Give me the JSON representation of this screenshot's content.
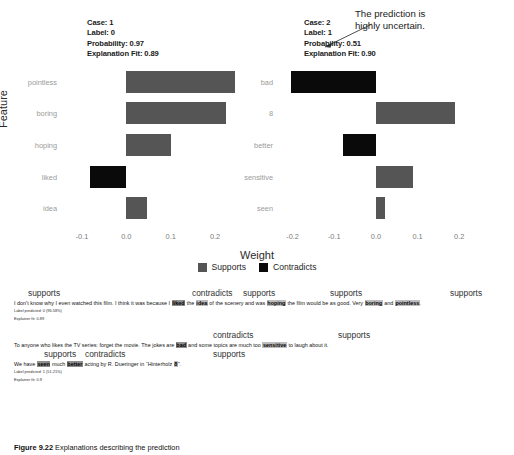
{
  "figure": {
    "ylabel": "Feature",
    "xlabel": "Weight",
    "annotation": "The prediction is\nhighly uncertain.",
    "annotation_line1": "The prediction is",
    "annotation_line2": "highly uncertain.",
    "legend": [
      {
        "label": "Supports",
        "color": "#555555",
        "key": "supports"
      },
      {
        "label": "Contradicts",
        "color": "#0a0a0a",
        "key": "contradicts"
      }
    ]
  },
  "chart_data": [
    {
      "type": "bar",
      "orientation": "horizontal",
      "title": "Case: 1",
      "header_lines": [
        "Case: 1",
        "Label: 0",
        "Probability: 0.97",
        "Explanation Fit: 0.89"
      ],
      "meta": {
        "case": "1",
        "label": "0",
        "probability": "0.97",
        "explanation_fit": "0.89"
      },
      "categories": [
        "pointless",
        "boring",
        "hoping",
        "liked",
        "idea"
      ],
      "values": [
        0.245,
        0.225,
        0.1,
        -0.083,
        0.046
      ],
      "bar_classes": [
        "supports",
        "supports",
        "supports",
        "contradicts",
        "supports"
      ],
      "xlabel": "Weight",
      "ylabel": "Feature",
      "xticks": [
        "-0.1",
        "0.0",
        "0.1",
        "0.2"
      ],
      "xtick_values": [
        -0.1,
        0.0,
        0.1,
        0.2
      ],
      "xlim": [
        -0.145,
        0.272
      ],
      "grid": false
    },
    {
      "type": "bar",
      "orientation": "horizontal",
      "title": "Case: 2",
      "header_lines": [
        "Case: 2",
        "Label: 1",
        "Probability: 0.51",
        "Explanation Fit: 0.90"
      ],
      "meta": {
        "case": "2",
        "label": "1",
        "probability": "0.51",
        "explanation_fit": "0.90"
      },
      "categories": [
        "bad",
        "8",
        "better",
        "sensitive",
        "seen"
      ],
      "values": [
        -0.205,
        0.19,
        -0.08,
        0.09,
        0.022
      ],
      "bar_classes": [
        "contradicts",
        "supports",
        "contradicts",
        "supports",
        "supports"
      ],
      "xlabel": "Weight",
      "ylabel": "Feature",
      "xticks": [
        "-0.2",
        "-0.1",
        "0.0",
        "0.1",
        "0.2"
      ],
      "xtick_values": [
        -0.2,
        -0.1,
        0.0,
        0.1,
        0.2
      ],
      "xlim": [
        -0.235,
        0.245
      ],
      "grid": false
    }
  ],
  "explanations": [
    {
      "tags": [
        {
          "text": "supports",
          "left": 28
        },
        {
          "text": "contradicts",
          "left": 192
        },
        {
          "text": "supports",
          "left": 243
        },
        {
          "text": "supports",
          "left": 330
        },
        {
          "text": "supports",
          "left": 450
        }
      ],
      "sentence_parts": [
        {
          "t": "I don't know why I even watched this film. I think it was because I ",
          "h": false
        },
        {
          "t": "liked",
          "h": true,
          "dark": true
        },
        {
          "t": " the ",
          "h": false
        },
        {
          "t": "idea",
          "h": true
        },
        {
          "t": " of the scenery and was ",
          "h": false
        },
        {
          "t": "hoping",
          "h": true
        },
        {
          "t": " the film would be as good. Very ",
          "h": false
        },
        {
          "t": "boring",
          "h": true
        },
        {
          "t": " and ",
          "h": false
        },
        {
          "t": "pointless",
          "h": true
        },
        {
          "t": ".",
          "h": false
        }
      ],
      "label_predicted": "Label predicted: 0 (96.58%)",
      "explainer_fit": "Explainer fit: 0.89"
    },
    {
      "tags": [
        {
          "text": "contradicts",
          "left": 213
        },
        {
          "text": "supports",
          "left": 338
        }
      ],
      "sentence_parts": [
        {
          "t": "To anyone who likes the TV series: forget the movie. The jokes are ",
          "h": false
        },
        {
          "t": "bad",
          "h": true,
          "dark": true
        },
        {
          "t": " and some topics are much too ",
          "h": false
        },
        {
          "t": "sensitive",
          "h": true
        },
        {
          "t": " to laugh about it.",
          "h": false
        }
      ],
      "tags2": [
        {
          "text": "supports",
          "left": 44
        },
        {
          "text": "contradicts",
          "left": 85
        },
        {
          "text": "supports",
          "left": 213
        }
      ],
      "sentence2_parts": [
        {
          "t": "We have ",
          "h": false
        },
        {
          "t": "seen",
          "h": true,
          "dark": true
        },
        {
          "t": " much ",
          "h": false
        },
        {
          "t": "better",
          "h": true,
          "dark": true
        },
        {
          "t": " acting by R. Dueringer in “Hinterholz ",
          "h": false
        },
        {
          "t": "8",
          "h": true
        },
        {
          "t": "”.",
          "h": false
        }
      ],
      "label_predicted": "Label predicted: 1 (51.21%)",
      "explainer_fit": "Explainer fit: 0.9"
    }
  ],
  "caption": {
    "number": "Figure 9.22",
    "text": "Explanations describing the prediction"
  }
}
